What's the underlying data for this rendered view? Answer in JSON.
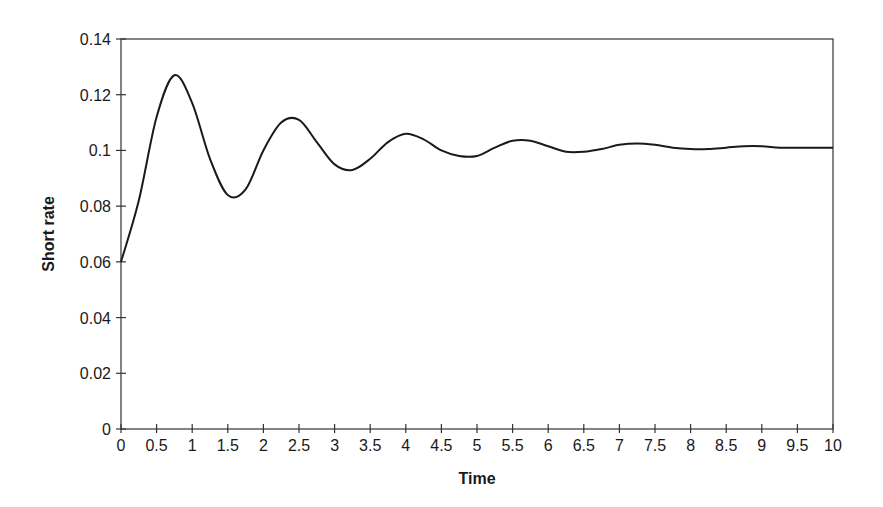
{
  "chart_data": {
    "type": "line",
    "title": "",
    "xlabel": "Time",
    "ylabel": "Short rate",
    "xlim": [
      0,
      10
    ],
    "ylim": [
      0,
      0.14
    ],
    "grid": false,
    "legend": null,
    "x_ticks": [
      "0",
      "0.5",
      "1",
      "1.5",
      "2",
      "2.5",
      "3",
      "3.5",
      "4",
      "4.5",
      "5",
      "5.5",
      "6",
      "6.5",
      "7",
      "7.5",
      "8",
      "8.5",
      "9",
      "9.5",
      "10"
    ],
    "y_ticks": [
      "0",
      "0.02",
      "0.04",
      "0.06",
      "0.08",
      "0.1",
      "0.12",
      "0.14"
    ],
    "series": [
      {
        "name": "Short rate",
        "color": "#1a1a1a",
        "x": [
          0,
          0.25,
          0.5,
          0.75,
          1.0,
          1.25,
          1.5,
          1.75,
          2.0,
          2.25,
          2.5,
          2.75,
          3.0,
          3.25,
          3.5,
          3.75,
          4.0,
          4.25,
          4.5,
          4.75,
          5.0,
          5.25,
          5.5,
          5.75,
          6.0,
          6.25,
          6.5,
          6.75,
          7.0,
          7.25,
          7.5,
          7.75,
          8.0,
          8.25,
          8.5,
          8.75,
          9.0,
          9.25,
          9.5,
          9.75,
          10.0
        ],
        "values": [
          0.06,
          0.082,
          0.112,
          0.127,
          0.117,
          0.097,
          0.084,
          0.086,
          0.1,
          0.11,
          0.111,
          0.103,
          0.095,
          0.093,
          0.097,
          0.103,
          0.106,
          0.104,
          0.1,
          0.098,
          0.098,
          0.101,
          0.1035,
          0.1035,
          0.1015,
          0.0995,
          0.0995,
          0.1005,
          0.102,
          0.1025,
          0.102,
          0.101,
          0.1005,
          0.1005,
          0.101,
          0.1015,
          0.1015,
          0.101,
          0.101,
          0.101,
          0.101
        ]
      }
    ]
  }
}
